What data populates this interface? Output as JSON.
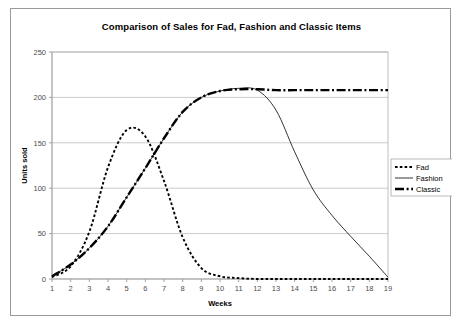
{
  "chart_data": {
    "type": "line",
    "title": "Comparison of Sales for Fad, Fashion and Classic Items",
    "xlabel": "Weeks",
    "ylabel": "Units sold",
    "grid": true,
    "legend_position": "right-middle",
    "x": [
      1,
      2,
      3,
      4,
      5,
      6,
      7,
      8,
      9,
      10,
      11,
      12,
      13,
      14,
      15,
      16,
      17,
      18,
      19
    ],
    "xlim": [
      1,
      19
    ],
    "ylim": [
      0,
      250
    ],
    "xticks": [
      "1",
      "2",
      "3",
      "4",
      "5",
      "6",
      "7",
      "8",
      "9",
      "10",
      "11",
      "12",
      "13",
      "14",
      "15",
      "16",
      "17",
      "18",
      "19"
    ],
    "yticks": [
      "0",
      "50",
      "100",
      "150",
      "200",
      "250"
    ],
    "series": [
      {
        "name": "Fad",
        "style": "dashed",
        "width": 1.9,
        "dash": "2.6,2.2",
        "values": [
          2,
          14,
          52,
          123,
          164,
          157,
          108,
          46,
          12,
          3,
          1,
          0,
          0,
          0,
          0,
          0,
          0,
          0,
          0
        ]
      },
      {
        "name": "Fashion",
        "style": "solid",
        "width": 0.8,
        "dash": "",
        "values": [
          3,
          16,
          34,
          58,
          90,
          122,
          155,
          184,
          200,
          207,
          210,
          208,
          186,
          140,
          98,
          70,
          47,
          25,
          2
        ]
      },
      {
        "name": "Classic",
        "style": "dash-dot",
        "width": 2.4,
        "dash": "9,2.6,2,2.6",
        "values": [
          3,
          16,
          34,
          58,
          90,
          122,
          155,
          184,
          200,
          207,
          209,
          209,
          208,
          208,
          208,
          208,
          208,
          208,
          208
        ]
      }
    ]
  },
  "legend": {
    "items": [
      {
        "label": "Fad"
      },
      {
        "label": "Fashion"
      },
      {
        "label": "Classic"
      }
    ]
  },
  "colors": {
    "series": "#000000",
    "grid": "#b6b6b6",
    "axis": "#8c8c8c",
    "frame": "#9a9a9a",
    "background": "#ffffff",
    "page": "#d9d9d9"
  }
}
